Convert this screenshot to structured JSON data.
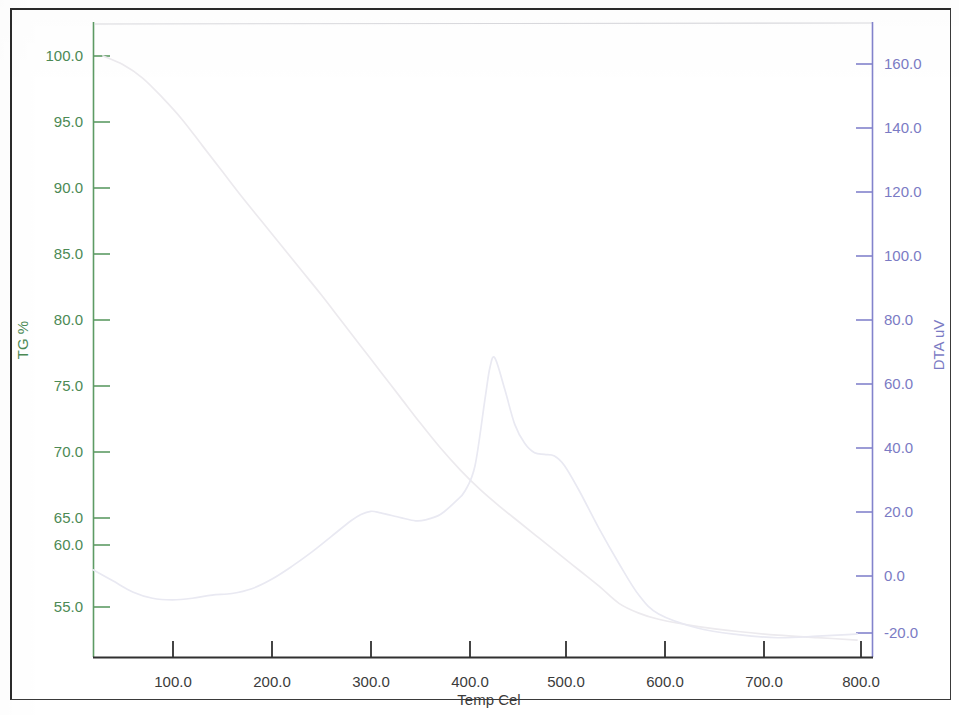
{
  "figure": {
    "title": "",
    "background_color": "#ffffff",
    "border_color": "#2b2b2b"
  },
  "axes": {
    "left": {
      "label": "TG %",
      "color": "#4c8a55",
      "ticks": [
        "100.0",
        "95.0",
        "90.0",
        "85.0",
        "80.0",
        "75.0",
        "70.0",
        "65.0",
        "60.0",
        "55.0"
      ],
      "min": 55.0,
      "max": 100.0,
      "step": 5.0
    },
    "right": {
      "label": "DTA uV",
      "color": "#7b7bc4",
      "ticks": [
        "160.0",
        "140.0",
        "120.0",
        "100.0",
        "80.0",
        "60.0",
        "40.0",
        "20.0",
        "0.0",
        "-20.0"
      ],
      "min": -20.0,
      "max": 160.0,
      "step": 20.0
    },
    "bottom": {
      "label": "Temp Cel",
      "color": "#3b3b3b",
      "ticks": [
        "100.0",
        "200.0",
        "300.0",
        "400.0",
        "500.0",
        "600.0",
        "700.0",
        "800.0"
      ],
      "min": 100.0,
      "max": 800.0,
      "step": 100.0
    }
  },
  "chart_data": {
    "type": "line",
    "title": "",
    "xlabel": "Temp Cel",
    "ylabel": "TG %",
    "y2label": "DTA uV",
    "xlim": [
      30,
      815
    ],
    "ylim": [
      51.0,
      102.0
    ],
    "y2lim": [
      -25.0,
      168.0
    ],
    "grid": false,
    "legend": "none",
    "series": [
      {
        "name": "TG %",
        "axis": "left",
        "color": "#eceaee",
        "x": [
          40,
          60,
          80,
          100,
          120,
          140,
          160,
          180,
          200,
          220,
          240,
          260,
          280,
          300,
          320,
          340,
          360,
          380,
          400,
          420,
          440,
          460,
          480,
          500,
          520,
          540,
          560,
          580,
          600,
          640,
          680,
          720,
          760,
          800
        ],
        "values": [
          100.0,
          99.3,
          98.2,
          96.6,
          94.8,
          92.7,
          90.6,
          88.5,
          86.5,
          84.5,
          82.5,
          80.5,
          78.4,
          76.3,
          74.2,
          72.1,
          70.0,
          68.0,
          66.2,
          64.6,
          63.2,
          61.9,
          60.6,
          59.3,
          58.0,
          56.7,
          55.3,
          54.5,
          54.0,
          53.4,
          53.0,
          52.7,
          52.5,
          52.3
        ]
      },
      {
        "name": "DTA uV",
        "axis": "right",
        "color": "#e9e9f2",
        "x": [
          30,
          50,
          70,
          90,
          110,
          130,
          150,
          170,
          190,
          210,
          230,
          250,
          270,
          290,
          300,
          310,
          320,
          340,
          355,
          365,
          380,
          395,
          405,
          415,
          425,
          430,
          435,
          445,
          455,
          465,
          475,
          485,
          495,
          505,
          520,
          540,
          560,
          580,
          600,
          640,
          680,
          720,
          760,
          790,
          800
        ],
        "values": [
          0.0,
          -3.5,
          -7.0,
          -9.0,
          -9.5,
          -9.0,
          -8.0,
          -7.5,
          -6.0,
          -3.0,
          1.0,
          5.5,
          10.5,
          15.5,
          17.5,
          18.5,
          18.0,
          16.5,
          15.5,
          15.8,
          17.5,
          21.5,
          25.0,
          33.0,
          54.0,
          64.0,
          67.0,
          57.0,
          46.0,
          40.0,
          37.0,
          36.5,
          36.0,
          33.0,
          25.0,
          13.0,
          2.0,
          -8.0,
          -14.0,
          -18.5,
          -20.5,
          -21.5,
          -21.0,
          -20.5,
          -20.3
        ]
      }
    ],
    "annotations": [
      {
        "name": "dta-main-peak",
        "x": 432,
        "y2": 67.0,
        "text": ""
      },
      {
        "name": "dta-broad-hump",
        "x": 310,
        "y2": 18.5,
        "text": ""
      },
      {
        "name": "dta-shoulder",
        "x": 485,
        "y2": 36.5,
        "text": ""
      }
    ]
  }
}
